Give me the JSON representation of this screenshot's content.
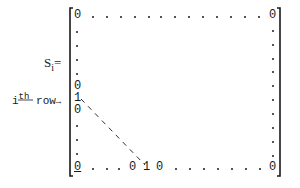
{
  "matrix_label": {
    "symbol": "S",
    "subscript": "i",
    "equals": "="
  },
  "row_label": {
    "index": "i",
    "superscript": "th",
    "text": "row",
    "arrow": "→"
  },
  "entries": {
    "zero": "0",
    "one": "1"
  },
  "top_row": {
    "first": "0",
    "last": "0"
  },
  "left_column": {
    "above_i": "0",
    "at_i": "1",
    "below_i": "0",
    "bottom": "0"
  },
  "bottom_row": {
    "first": "0",
    "before_one": "0",
    "one": "1",
    "after_one": "0",
    "last": "0"
  },
  "colors": {
    "ink": "#1a1a1a",
    "background": "#ffffff"
  }
}
